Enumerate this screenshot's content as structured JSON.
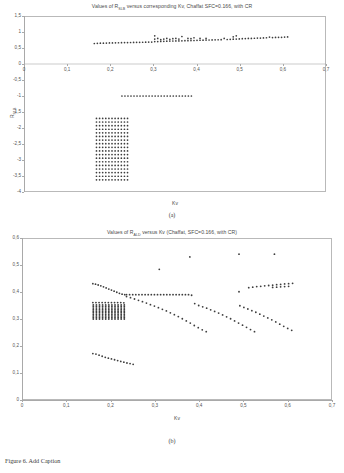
{
  "figure": {
    "caption": "Figure 6.  Add Caption",
    "panel_a_letter": "(a)",
    "panel_b_letter": "(b)"
  },
  "chart_data": [
    {
      "id": "panel_a",
      "type": "scatter",
      "title_prefix": "Values of R",
      "title_subscript": "SLB",
      "title_suffix": " versus corresponding Kv, Chaffat SFC=0.166, with CR",
      "title": "Values of RSLB versus corresponding Kv, Chaffat SFC=0.166, with CR",
      "xlabel": "Kv",
      "ylabel_prefix": "R",
      "ylabel_subscript": "SLB",
      "ylabel": "RSLB",
      "xlim": [
        0,
        0.7
      ],
      "ylim": [
        -4,
        1.5
      ],
      "grid": false,
      "legend": "none",
      "xticks": [
        "0",
        "0,1",
        "0,2",
        "0,3",
        "0,4",
        "0,5",
        "0,6",
        "0,7"
      ],
      "xtick_values": [
        0,
        0.1,
        0.2,
        0.3,
        0.4,
        0.5,
        0.6,
        0.7
      ],
      "yticks": [
        "1,5",
        "1",
        "0,5",
        "0",
        "-0,5",
        "-1",
        "-1,5",
        "-2",
        "-2,5",
        "-3",
        "-3,5",
        "-4"
      ],
      "ytick_values": [
        1.5,
        1,
        0.5,
        0,
        -0.5,
        -1,
        -1.5,
        -2,
        -2.5,
        -3,
        -3.5,
        -4
      ],
      "series": [
        {
          "name": "upper band",
          "x": [
            0.163,
            0.17,
            0.177,
            0.184,
            0.191,
            0.198,
            0.205,
            0.212,
            0.219,
            0.226,
            0.233,
            0.24,
            0.247,
            0.254,
            0.261,
            0.268,
            0.275,
            0.282,
            0.289,
            0.296,
            0.303,
            0.303,
            0.303,
            0.31,
            0.31,
            0.317,
            0.317,
            0.324,
            0.324,
            0.331,
            0.331,
            0.338,
            0.338,
            0.345,
            0.345,
            0.352,
            0.352,
            0.359,
            0.359,
            0.366,
            0.366,
            0.373,
            0.38,
            0.38,
            0.387,
            0.387,
            0.394,
            0.394,
            0.401,
            0.408,
            0.408,
            0.415,
            0.422,
            0.422,
            0.429,
            0.436,
            0.443,
            0.45,
            0.457,
            0.464,
            0.471,
            0.478,
            0.485,
            0.485,
            0.492,
            0.492,
            0.499,
            0.506,
            0.513,
            0.52,
            0.527,
            0.534,
            0.541,
            0.548,
            0.555,
            0.562,
            0.569,
            0.576,
            0.583,
            0.59,
            0.597,
            0.604,
            0.611
          ],
          "y": [
            0.64,
            0.645,
            0.65,
            0.652,
            0.655,
            0.658,
            0.66,
            0.662,
            0.664,
            0.666,
            0.668,
            0.67,
            0.672,
            0.674,
            0.676,
            0.678,
            0.68,
            0.682,
            0.684,
            0.686,
            0.7,
            0.78,
            0.88,
            0.7,
            0.8,
            0.705,
            0.76,
            0.71,
            0.78,
            0.712,
            0.8,
            0.715,
            0.77,
            0.718,
            0.79,
            0.72,
            0.8,
            0.722,
            0.78,
            0.725,
            0.86,
            0.728,
            0.73,
            0.8,
            0.732,
            0.79,
            0.735,
            0.82,
            0.74,
            0.742,
            0.8,
            0.745,
            0.748,
            0.8,
            0.75,
            0.752,
            0.755,
            0.758,
            0.76,
            0.8,
            0.765,
            0.77,
            0.775,
            0.85,
            0.78,
            0.88,
            0.785,
            0.79,
            0.795,
            0.8,
            0.8,
            0.805,
            0.81,
            0.81,
            0.815,
            0.82,
            0.84,
            0.825,
            0.83,
            0.835,
            0.835,
            0.84,
            0.845
          ]
        },
        {
          "name": "mid line at -1",
          "x": [
            0.227,
            0.234,
            0.241,
            0.248,
            0.255,
            0.262,
            0.269,
            0.276,
            0.283,
            0.29,
            0.297,
            0.304,
            0.311,
            0.318,
            0.325,
            0.332,
            0.339,
            0.346,
            0.353,
            0.36,
            0.367,
            0.374,
            0.381,
            0.388
          ],
          "y": [
            -1.0,
            -1.0,
            -1.0,
            -1.0,
            -1.0,
            -1.0,
            -1.0,
            -1.0,
            -1.0,
            -1.0,
            -1.0,
            -1.0,
            -1.0,
            -1.0,
            -1.0,
            -1.0,
            -1.0,
            -1.0,
            -1.0,
            -1.0,
            -1.0,
            -1.0,
            -1.0,
            -1.0
          ]
        },
        {
          "name": "lower dense grid cluster",
          "x_range": [
            0.168,
            0.24
          ],
          "y_range": [
            -3.62,
            -1.7
          ],
          "nx": 11,
          "ny": 18
        }
      ]
    },
    {
      "id": "panel_b",
      "type": "scatter",
      "title_prefix": "Values of R",
      "title_subscript": "ALD",
      "title_suffix": " versus Kv (Chaffat, SFC=0.166, with CR)",
      "title": "Values of RALD versus Kv (Chaffat, SFC=0.166, with CR)",
      "xlabel": "Kv",
      "ylabel": "",
      "xlim": [
        0,
        0.7
      ],
      "ylim": [
        0,
        0.6
      ],
      "grid": false,
      "legend": "none",
      "xticks": [
        "0",
        "0,1",
        "0,2",
        "0,3",
        "0,4",
        "0,5",
        "0,6",
        "0,7"
      ],
      "xtick_values": [
        0,
        0.1,
        0.2,
        0.3,
        0.4,
        0.5,
        0.6,
        0.7
      ],
      "yticks": [
        "0",
        "0,1",
        "0,2",
        "0,3",
        "0,4",
        "0,5",
        "0,6"
      ],
      "ytick_values": [
        0,
        0.1,
        0.2,
        0.3,
        0.4,
        0.5,
        0.6
      ],
      "series": [
        {
          "name": "outliers high",
          "x": [
            0.31,
            0.379,
            0.49,
            0.49,
            0.57
          ],
          "y": [
            0.484,
            0.53,
            0.54,
            0.401,
            0.54
          ]
        },
        {
          "name": "upper descending arc",
          "x": [
            0.16,
            0.166,
            0.172,
            0.178,
            0.184,
            0.19,
            0.196,
            0.202,
            0.208,
            0.214,
            0.22,
            0.226,
            0.232
          ],
          "y": [
            0.431,
            0.429,
            0.426,
            0.423,
            0.419,
            0.415,
            0.411,
            0.407,
            0.403,
            0.399,
            0.395,
            0.392,
            0.39
          ]
        },
        {
          "name": "plateau band",
          "x": [
            0.236,
            0.243,
            0.25,
            0.257,
            0.264,
            0.271,
            0.278,
            0.285,
            0.292,
            0.299,
            0.306,
            0.313,
            0.32,
            0.327,
            0.334,
            0.341,
            0.348,
            0.355,
            0.362,
            0.369,
            0.376,
            0.383
          ],
          "y": [
            0.39,
            0.39,
            0.39,
            0.39,
            0.39,
            0.39,
            0.39,
            0.39,
            0.39,
            0.39,
            0.39,
            0.39,
            0.39,
            0.39,
            0.39,
            0.39,
            0.39,
            0.39,
            0.39,
            0.39,
            0.39,
            0.388
          ]
        },
        {
          "name": "second band 0,36",
          "x": [
            0.16,
            0.167,
            0.174,
            0.181,
            0.188,
            0.195,
            0.202,
            0.209,
            0.216,
            0.223,
            0.23
          ],
          "y": [
            0.361,
            0.361,
            0.361,
            0.361,
            0.361,
            0.361,
            0.361,
            0.361,
            0.361,
            0.361,
            0.36
          ]
        },
        {
          "name": "descending branch mid",
          "x": [
            0.236,
            0.245,
            0.254,
            0.263,
            0.272,
            0.281,
            0.29,
            0.299,
            0.308,
            0.317,
            0.326,
            0.335,
            0.344,
            0.353,
            0.362,
            0.371,
            0.38,
            0.389,
            0.398,
            0.407,
            0.416
          ],
          "y": [
            0.383,
            0.379,
            0.374,
            0.369,
            0.364,
            0.359,
            0.353,
            0.348,
            0.342,
            0.336,
            0.33,
            0.323,
            0.316,
            0.309,
            0.301,
            0.293,
            0.285,
            0.276,
            0.268,
            0.26,
            0.253
          ]
        },
        {
          "name": "descending branch right",
          "x": [
            0.39,
            0.399,
            0.408,
            0.417,
            0.426,
            0.435,
            0.444,
            0.453,
            0.462,
            0.471,
            0.48,
            0.489,
            0.498,
            0.507,
            0.516,
            0.525
          ],
          "y": [
            0.357,
            0.35,
            0.345,
            0.34,
            0.334,
            0.328,
            0.322,
            0.315,
            0.308,
            0.301,
            0.293,
            0.285,
            0.277,
            0.269,
            0.261,
            0.253
          ]
        },
        {
          "name": "descending branch far right",
          "x": [
            0.492,
            0.501,
            0.51,
            0.519,
            0.528,
            0.537,
            0.546,
            0.555,
            0.564,
            0.573,
            0.582,
            0.591,
            0.6,
            0.609
          ],
          "y": [
            0.349,
            0.343,
            0.337,
            0.331,
            0.325,
            0.318,
            0.311,
            0.304,
            0.297,
            0.289,
            0.281,
            0.273,
            0.265,
            0.258
          ]
        },
        {
          "name": "right rising band",
          "x": [
            0.512,
            0.521,
            0.53,
            0.539,
            0.548,
            0.557,
            0.566,
            0.575,
            0.584,
            0.593,
            0.602,
            0.611
          ],
          "y": [
            0.416,
            0.418,
            0.42,
            0.421,
            0.423,
            0.424,
            0.425,
            0.427,
            0.428,
            0.43,
            0.431,
            0.432
          ]
        },
        {
          "name": "right rising band lower",
          "x": [
            0.566,
            0.575,
            0.584,
            0.593,
            0.602
          ],
          "y": [
            0.417,
            0.418,
            0.419,
            0.42,
            0.421
          ]
        },
        {
          "name": "low arc",
          "x": [
            0.16,
            0.167,
            0.174,
            0.181,
            0.188,
            0.195,
            0.202,
            0.209,
            0.216,
            0.223,
            0.23,
            0.237,
            0.244,
            0.251
          ],
          "y": [
            0.172,
            0.17,
            0.166,
            0.162,
            0.158,
            0.155,
            0.152,
            0.149,
            0.146,
            0.143,
            0.14,
            0.137,
            0.135,
            0.132
          ]
        },
        {
          "name": "dense vertical bars cluster",
          "x_positions": [
            0.161,
            0.168,
            0.175,
            0.182,
            0.189,
            0.196,
            0.203,
            0.21,
            0.217,
            0.224,
            0.231
          ],
          "y_range": [
            0.3,
            0.352
          ],
          "ny": 10
        }
      ]
    }
  ]
}
